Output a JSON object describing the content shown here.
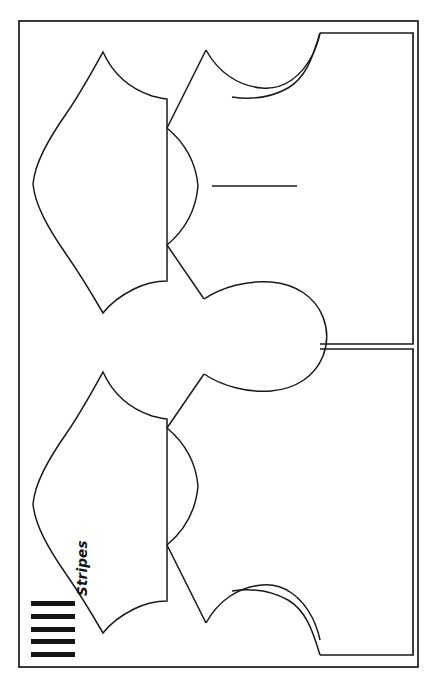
{
  "document": {
    "type": "sewing-pattern-layout-diagram",
    "title": "",
    "background_color": "#ffffff",
    "line_color": "#1a1a1a",
    "width": 437,
    "height": 685
  },
  "legend": {
    "label": "Stripes",
    "label_rotation_degrees": -90,
    "swatch": {
      "name": "stripes-swatch",
      "bar_count": 5,
      "bar_color": "#151515",
      "orientation": "horizontal"
    }
  },
  "frame": {
    "name": "fabric-outer-border",
    "stroke": "#1a1a1a",
    "stroke_width": 1.6,
    "x": 19,
    "y": 21,
    "width": 399,
    "height": 646
  },
  "panels": [
    {
      "name": "right-panel-upper",
      "x": 320,
      "y": 33,
      "width": 93,
      "height": 311
    },
    {
      "name": "right-panel-lower",
      "x": 320,
      "y": 349,
      "width": 93,
      "height": 306
    }
  ],
  "pieces": [
    {
      "name": "bodice-piece-top-left",
      "description": "leaf shaped bodice half with straight right edge"
    },
    {
      "name": "sleeve-piece-top-right",
      "description": "upper sleeve with shoulder curve and armhole notch"
    },
    {
      "name": "center-sleeve-bulb",
      "description": "rounded central sleeve cap shape"
    },
    {
      "name": "bodice-piece-bottom-left",
      "description": "mirrored leaf shaped bodice half"
    },
    {
      "name": "sleeve-piece-bottom-right",
      "description": "mirrored lower sleeve with hem curve"
    }
  ],
  "guides": [
    {
      "name": "grainline-guide",
      "description": "horizontal straight guide line at center",
      "x1": 212,
      "y1": 186,
      "x2": 297,
      "y2": 186
    }
  ]
}
